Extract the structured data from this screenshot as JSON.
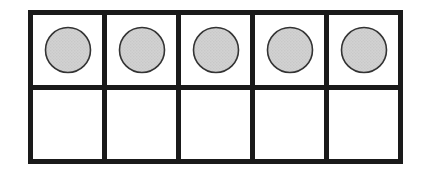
{
  "figure": {
    "rows": 2,
    "columns": 5,
    "total_cells": 10,
    "filled_count": 5,
    "empty_count": 5
  },
  "colors": {
    "frame_line": "#1a1a1a",
    "cell_background": "#ffffff",
    "counter_fill": "#cccccc",
    "counter_stroke": "#333333",
    "page_background": "#ffffff"
  },
  "cells": [
    {
      "index": 1,
      "row": 1,
      "column": 1,
      "filled": true,
      "counter_label": "counter"
    },
    {
      "index": 2,
      "row": 1,
      "column": 2,
      "filled": true,
      "counter_label": "counter"
    },
    {
      "index": 3,
      "row": 1,
      "column": 3,
      "filled": true,
      "counter_label": "counter"
    },
    {
      "index": 4,
      "row": 1,
      "column": 4,
      "filled": true,
      "counter_label": "counter"
    },
    {
      "index": 5,
      "row": 1,
      "column": 5,
      "filled": true,
      "counter_label": "counter"
    },
    {
      "index": 6,
      "row": 2,
      "column": 1,
      "filled": false,
      "counter_label": ""
    },
    {
      "index": 7,
      "row": 2,
      "column": 2,
      "filled": false,
      "counter_label": ""
    },
    {
      "index": 8,
      "row": 2,
      "column": 3,
      "filled": false,
      "counter_label": ""
    },
    {
      "index": 9,
      "row": 2,
      "column": 4,
      "filled": false,
      "counter_label": ""
    },
    {
      "index": 10,
      "row": 2,
      "column": 5,
      "filled": false,
      "counter_label": ""
    }
  ]
}
